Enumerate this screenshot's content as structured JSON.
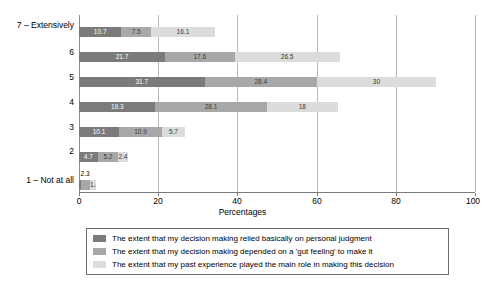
{
  "chart_data": {
    "type": "bar",
    "orientation": "horizontal",
    "stacked": true,
    "title": "",
    "xlabel": "Percentages",
    "ylabel": "",
    "xlim": [
      0,
      100
    ],
    "xticks": [
      "0",
      "20",
      "40",
      "60",
      "80",
      "100"
    ],
    "grid": true,
    "legend_position": "bottom",
    "categories": [
      "7 – Extensively",
      "6",
      "5",
      "4",
      "3",
      "2",
      "1 – Not at all"
    ],
    "series": [
      {
        "name": "The extent that my decision making relied basically on personal judgment",
        "color": "#7b7b7b",
        "values": [
          10.7,
          21.7,
          31.7,
          19.3,
          10.1,
          4.7,
          0.5
        ],
        "labels": [
          "10.7",
          "21.7",
          "31.7",
          "19.3",
          "10.1",
          "4.7",
          ""
        ]
      },
      {
        "name": "The extent that my decision making depended on a 'gut feeling' to make it",
        "color": "#a8a8a8",
        "values": [
          7.5,
          17.6,
          28.4,
          28.1,
          10.9,
          5.2,
          2.3
        ],
        "labels": [
          "7.5",
          "17.6",
          "28.4",
          "28.1",
          "10.9",
          "5.2",
          "2.3"
        ]
      },
      {
        "name": "The extent that my past experience played the main role in making this decision",
        "color": "#dcdcdc",
        "values": [
          16.1,
          26.5,
          30.0,
          18.0,
          5.7,
          2.4,
          1.4
        ],
        "labels": [
          "16.1",
          "26.5",
          "30",
          "18",
          "5.7",
          "2.4",
          "1.4"
        ]
      }
    ]
  },
  "axis": {
    "x_title": "Percentages",
    "x_ticks": [
      "0",
      "20",
      "40",
      "60",
      "80",
      "100"
    ],
    "y_ticks": [
      "7 – Extensively",
      "6",
      "5",
      "4",
      "3",
      "2",
      "1 – Not at all"
    ]
  },
  "legend": {
    "items": [
      {
        "label": "The extent that my decision making relied basically on personal judgment"
      },
      {
        "label": "The extent that my decision making depended on a 'gut feeling' to make it"
      },
      {
        "label": "The extent that my past experience played the main role in making this decision"
      }
    ]
  }
}
